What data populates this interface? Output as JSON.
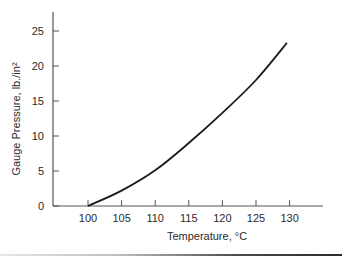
{
  "chart_data": {
    "type": "line",
    "title": "",
    "xlabel": "Temperature, °C",
    "ylabel": "Gauge Pressure, lb./in²",
    "xlim": [
      90,
      135
    ],
    "ylim": [
      0,
      27
    ],
    "x_ticks": [
      100,
      105,
      110,
      115,
      120,
      125,
      130
    ],
    "y_ticks": [
      0,
      5,
      10,
      15,
      20,
      25
    ],
    "x_tick_labels": [
      "100",
      "105",
      "110",
      "115",
      "120",
      "125",
      "130"
    ],
    "y_tick_labels": [
      "0",
      "5",
      "10",
      "15",
      "20",
      "25"
    ],
    "grid": false,
    "legend": null,
    "series": [
      {
        "name": "Gauge Pressure vs Temperature",
        "x": [
          100,
          105,
          110,
          115,
          120,
          125,
          129.6
        ],
        "y": [
          0,
          2.2,
          5.1,
          9.0,
          13.3,
          18.0,
          23.3
        ]
      }
    ],
    "colors": {
      "line": "#1a1a1a",
      "axis": "#555555"
    }
  }
}
